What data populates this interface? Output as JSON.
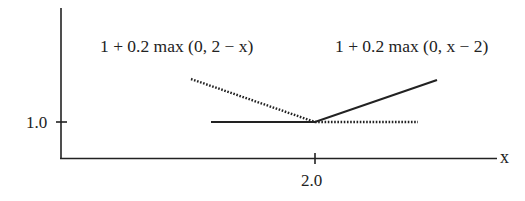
{
  "diagram": {
    "type": "piecewise-linear function plot",
    "axes": {
      "x_label": "x",
      "y_tick_label": "1.0",
      "x_tick_label": "2.0"
    },
    "curves": [
      {
        "name": "decreasing-hinge",
        "formula": "1 + 0.2 max (0, 2 − x)",
        "style": "dotted",
        "description": "dotted line falls to 1.0 at x = 2.0, then stays flat at 1.0"
      },
      {
        "name": "increasing-hinge",
        "formula": "1 + 0.2 max (0, x − 2)",
        "style": "solid",
        "description": "solid line flat at 1.0 until x = 2.0, then rises"
      }
    ],
    "colors": {
      "line": "#222222",
      "background": "#ffffff"
    }
  }
}
